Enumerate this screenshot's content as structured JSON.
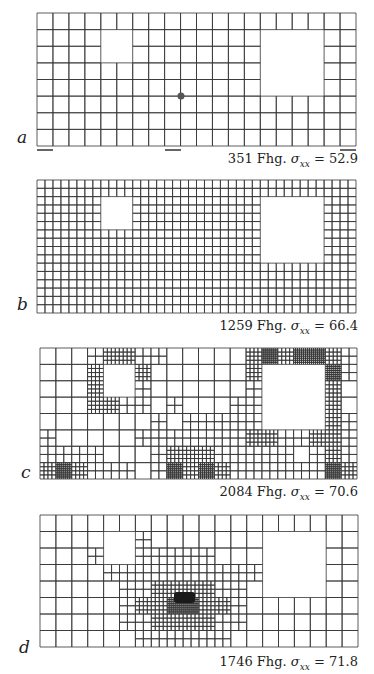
{
  "figure": {
    "panels": [
      {
        "id": "a",
        "label": "a",
        "count": "351",
        "unit": "Fhg.",
        "sigma_symbol": "σ",
        "sigma_sub": "xx",
        "equals": "=",
        "value": "52.9",
        "box": {
          "x": 37,
          "y": 13,
          "w": 319,
          "h": 133
        },
        "cols": 20,
        "rows": 8,
        "holes": [
          {
            "c0": 4,
            "r0": 1,
            "c1": 6,
            "r1": 3
          },
          {
            "c0": 14,
            "r0": 1,
            "c1": 18,
            "r1": 5
          }
        ],
        "refine": [],
        "dot": {
          "x": 181,
          "y": 96
        },
        "dashes": [
          {
            "x1": 37,
            "x2": 53,
            "y": 150
          },
          {
            "x1": 165,
            "x2": 181,
            "y": 150
          },
          {
            "x1": 340,
            "x2": 356,
            "y": 150
          }
        ],
        "label_pos": {
          "x": 17,
          "y": 131
        },
        "caption_y": 151
      },
      {
        "id": "b",
        "label": "b",
        "count": "1259",
        "unit": "Fhg.",
        "sigma_symbol": "σ",
        "sigma_sub": "xx",
        "equals": "=",
        "value": "66.4",
        "box": {
          "x": 37,
          "y": 180,
          "w": 319,
          "h": 133
        },
        "cols": 40,
        "rows": 16,
        "holes": [
          {
            "c0": 8,
            "r0": 2,
            "c1": 12,
            "r1": 6
          },
          {
            "c0": 28,
            "r0": 2,
            "c1": 36,
            "r1": 10
          }
        ],
        "refine": [],
        "label_pos": {
          "x": 17,
          "y": 298
        },
        "caption_y": 318
      },
      {
        "id": "c",
        "label": "c",
        "count": "2084",
        "unit": "Fhg.",
        "sigma_symbol": "σ",
        "sigma_sub": "xx",
        "equals": "=",
        "value": "70.6",
        "box": {
          "x": 40,
          "y": 348,
          "w": 317,
          "h": 131
        },
        "cols": 20,
        "rows": 8,
        "holes": [
          {
            "c0": 4,
            "r0": 1,
            "c1": 6,
            "r1": 3
          },
          {
            "c0": 14,
            "r0": 1,
            "c1": 18,
            "r1": 5
          }
        ],
        "refine": [
          {
            "c": 3,
            "r": 0,
            "lvl": 1
          },
          {
            "c": 4,
            "r": 0,
            "lvl": 2
          },
          {
            "c": 5,
            "r": 0,
            "lvl": 2
          },
          {
            "c": 6,
            "r": 0,
            "lvl": 1
          },
          {
            "c": 3,
            "r": 1,
            "lvl": 2
          },
          {
            "c": 6,
            "r": 1,
            "lvl": 2
          },
          {
            "c": 3,
            "r": 2,
            "lvl": 2
          },
          {
            "c": 6,
            "r": 2,
            "lvl": 1
          },
          {
            "c": 3,
            "r": 3,
            "lvl": 2
          },
          {
            "c": 4,
            "r": 3,
            "lvl": 2
          },
          {
            "c": 5,
            "r": 3,
            "lvl": 1
          },
          {
            "c": 6,
            "r": 3,
            "lvl": 1
          },
          {
            "c": 7,
            "r": 0,
            "lvl": 1
          },
          {
            "c": 2,
            "r": 1,
            "lvl": 0
          },
          {
            "c": 13,
            "r": 0,
            "lvl": 2
          },
          {
            "c": 14,
            "r": 0,
            "lvl": 3
          },
          {
            "c": 15,
            "r": 0,
            "lvl": 2
          },
          {
            "c": 16,
            "r": 0,
            "lvl": 3
          },
          {
            "c": 17,
            "r": 0,
            "lvl": 3
          },
          {
            "c": 18,
            "r": 0,
            "lvl": 2
          },
          {
            "c": 19,
            "r": 0,
            "lvl": 1
          },
          {
            "c": 13,
            "r": 1,
            "lvl": 2
          },
          {
            "c": 18,
            "r": 1,
            "lvl": 3
          },
          {
            "c": 19,
            "r": 1,
            "lvl": 1
          },
          {
            "c": 13,
            "r": 2,
            "lvl": 1
          },
          {
            "c": 18,
            "r": 2,
            "lvl": 2
          },
          {
            "c": 13,
            "r": 3,
            "lvl": 1
          },
          {
            "c": 18,
            "r": 3,
            "lvl": 2
          },
          {
            "c": 13,
            "r": 4,
            "lvl": 1
          },
          {
            "c": 18,
            "r": 4,
            "lvl": 2
          },
          {
            "c": 19,
            "r": 4,
            "lvl": 1
          },
          {
            "c": 13,
            "r": 5,
            "lvl": 2
          },
          {
            "c": 14,
            "r": 5,
            "lvl": 2
          },
          {
            "c": 15,
            "r": 5,
            "lvl": 1
          },
          {
            "c": 16,
            "r": 5,
            "lvl": 1
          },
          {
            "c": 17,
            "r": 5,
            "lvl": 2
          },
          {
            "c": 18,
            "r": 5,
            "lvl": 2
          },
          {
            "c": 19,
            "r": 5,
            "lvl": 1
          },
          {
            "c": 8,
            "r": 3,
            "lvl": 1
          },
          {
            "c": 9,
            "r": 4,
            "lvl": 1
          },
          {
            "c": 10,
            "r": 4,
            "lvl": 1
          },
          {
            "c": 11,
            "r": 4,
            "lvl": 1
          },
          {
            "c": 7,
            "r": 4,
            "lvl": 1
          },
          {
            "c": 12,
            "r": 4,
            "lvl": 1
          },
          {
            "c": 12,
            "r": 3,
            "lvl": 1
          },
          {
            "c": 6,
            "r": 5,
            "lvl": 1
          },
          {
            "c": 7,
            "r": 5,
            "lvl": 1
          },
          {
            "c": 8,
            "r": 5,
            "lvl": 1
          },
          {
            "c": 9,
            "r": 5,
            "lvl": 1
          },
          {
            "c": 10,
            "r": 5,
            "lvl": 1
          },
          {
            "c": 11,
            "r": 5,
            "lvl": 1
          },
          {
            "c": 12,
            "r": 5,
            "lvl": 1
          },
          {
            "c": 7,
            "r": 6,
            "lvl": 1
          },
          {
            "c": 8,
            "r": 6,
            "lvl": 2
          },
          {
            "c": 9,
            "r": 6,
            "lvl": 2
          },
          {
            "c": 10,
            "r": 6,
            "lvl": 2
          },
          {
            "c": 11,
            "r": 6,
            "lvl": 1
          },
          {
            "c": 12,
            "r": 6,
            "lvl": 1
          },
          {
            "c": 13,
            "r": 6,
            "lvl": 1
          },
          {
            "c": 14,
            "r": 6,
            "lvl": 1
          },
          {
            "c": 7,
            "r": 7,
            "lvl": 1
          },
          {
            "c": 8,
            "r": 7,
            "lvl": 3
          },
          {
            "c": 9,
            "r": 7,
            "lvl": 2
          },
          {
            "c": 10,
            "r": 7,
            "lvl": 3
          },
          {
            "c": 11,
            "r": 7,
            "lvl": 2
          },
          {
            "c": 12,
            "r": 7,
            "lvl": 1
          },
          {
            "c": 13,
            "r": 7,
            "lvl": 1
          },
          {
            "c": 14,
            "r": 7,
            "lvl": 1
          },
          {
            "c": 15,
            "r": 6,
            "lvl": 1
          },
          {
            "c": 16,
            "r": 7,
            "lvl": 1
          },
          {
            "c": 15,
            "r": 7,
            "lvl": 1
          },
          {
            "c": 0,
            "r": 5,
            "lvl": 1
          },
          {
            "c": 0,
            "r": 6,
            "lvl": 1
          },
          {
            "c": 1,
            "r": 6,
            "lvl": 1
          },
          {
            "c": 2,
            "r": 6,
            "lvl": 1
          },
          {
            "c": 3,
            "r": 6,
            "lvl": 1
          },
          {
            "c": 0,
            "r": 7,
            "lvl": 2
          },
          {
            "c": 1,
            "r": 7,
            "lvl": 3
          },
          {
            "c": 2,
            "r": 7,
            "lvl": 2
          },
          {
            "c": 3,
            "r": 7,
            "lvl": 1
          },
          {
            "c": 4,
            "r": 7,
            "lvl": 1
          },
          {
            "c": 5,
            "r": 7,
            "lvl": 1
          },
          {
            "c": 18,
            "r": 6,
            "lvl": 2
          },
          {
            "c": 19,
            "r": 6,
            "lvl": 1
          },
          {
            "c": 18,
            "r": 7,
            "lvl": 3
          },
          {
            "c": 19,
            "r": 7,
            "lvl": 2
          },
          {
            "c": 17,
            "r": 7,
            "lvl": 1
          },
          {
            "c": 17,
            "r": 6,
            "lvl": 1
          }
        ],
        "label_pos": {
          "x": 21,
          "y": 466
        },
        "caption_y": 484
      },
      {
        "id": "d",
        "label": "d",
        "count": "1746",
        "unit": "Fhg.",
        "sigma_symbol": "σ",
        "sigma_sub": "xx",
        "equals": "=",
        "value": "71.8",
        "box": {
          "x": 40,
          "y": 515,
          "w": 318,
          "h": 132
        },
        "cols": 20,
        "rows": 8,
        "holes": [
          {
            "c0": 4,
            "r0": 1,
            "c1": 6,
            "r1": 3
          },
          {
            "c0": 14,
            "r0": 1,
            "c1": 18,
            "r1": 5
          }
        ],
        "refine": [
          {
            "c": 3,
            "r": 2,
            "lvl": 1
          },
          {
            "c": 6,
            "r": 1,
            "lvl": 1
          },
          {
            "c": 6,
            "r": 2,
            "lvl": 1
          },
          {
            "c": 7,
            "r": 2,
            "lvl": 1
          },
          {
            "c": 8,
            "r": 2,
            "lvl": 1
          },
          {
            "c": 9,
            "r": 2,
            "lvl": 1
          },
          {
            "c": 10,
            "r": 2,
            "lvl": 1
          },
          {
            "c": 4,
            "r": 3,
            "lvl": 1
          },
          {
            "c": 5,
            "r": 3,
            "lvl": 1
          },
          {
            "c": 6,
            "r": 3,
            "lvl": 1
          },
          {
            "c": 7,
            "r": 3,
            "lvl": 1
          },
          {
            "c": 8,
            "r": 3,
            "lvl": 1
          },
          {
            "c": 9,
            "r": 3,
            "lvl": 1
          },
          {
            "c": 10,
            "r": 3,
            "lvl": 1
          },
          {
            "c": 11,
            "r": 3,
            "lvl": 1
          },
          {
            "c": 12,
            "r": 3,
            "lvl": 1
          },
          {
            "c": 13,
            "r": 3,
            "lvl": 1
          },
          {
            "c": 5,
            "r": 4,
            "lvl": 1
          },
          {
            "c": 6,
            "r": 4,
            "lvl": 1
          },
          {
            "c": 7,
            "r": 4,
            "lvl": 2
          },
          {
            "c": 8,
            "r": 4,
            "lvl": 2
          },
          {
            "c": 9,
            "r": 4,
            "lvl": 2
          },
          {
            "c": 10,
            "r": 4,
            "lvl": 2
          },
          {
            "c": 11,
            "r": 4,
            "lvl": 1
          },
          {
            "c": 12,
            "r": 4,
            "lvl": 1
          },
          {
            "c": 5,
            "r": 5,
            "lvl": 1
          },
          {
            "c": 6,
            "r": 5,
            "lvl": 2
          },
          {
            "c": 7,
            "r": 5,
            "lvl": 2
          },
          {
            "c": 8,
            "r": 5,
            "lvl": 3
          },
          {
            "c": 9,
            "r": 5,
            "lvl": 3
          },
          {
            "c": 10,
            "r": 5,
            "lvl": 2
          },
          {
            "c": 11,
            "r": 5,
            "lvl": 2
          },
          {
            "c": 12,
            "r": 5,
            "lvl": 1
          },
          {
            "c": 5,
            "r": 6,
            "lvl": 1
          },
          {
            "c": 6,
            "r": 6,
            "lvl": 1
          },
          {
            "c": 7,
            "r": 6,
            "lvl": 2
          },
          {
            "c": 8,
            "r": 6,
            "lvl": 2
          },
          {
            "c": 9,
            "r": 6,
            "lvl": 2
          },
          {
            "c": 10,
            "r": 6,
            "lvl": 2
          },
          {
            "c": 11,
            "r": 6,
            "lvl": 1
          },
          {
            "c": 12,
            "r": 6,
            "lvl": 1
          },
          {
            "c": 6,
            "r": 7,
            "lvl": 1
          },
          {
            "c": 7,
            "r": 7,
            "lvl": 1
          },
          {
            "c": 8,
            "r": 7,
            "lvl": 1
          },
          {
            "c": 9,
            "r": 7,
            "lvl": 1
          },
          {
            "c": 10,
            "r": 7,
            "lvl": 1
          },
          {
            "c": 11,
            "r": 7,
            "lvl": 1
          }
        ],
        "blob": {
          "x": 174,
          "y": 592,
          "w": 21,
          "h": 11
        },
        "label_pos": {
          "x": 19,
          "y": 641
        },
        "caption_y": 654
      }
    ]
  }
}
